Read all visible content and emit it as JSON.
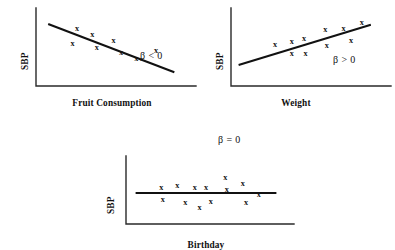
{
  "figure": {
    "background_color": "#ffffff",
    "marker_glyph": "x",
    "line_color": "#111111",
    "axis_color": "#2a2a2a"
  },
  "chart_data": [
    {
      "type": "scatter",
      "title": "",
      "xlabel": "Fruit Consumption",
      "ylabel": "SBP",
      "annotation": "β < 0",
      "xlim": [
        0,
        100
      ],
      "ylim": [
        0,
        100
      ],
      "grid": false,
      "legend": "none",
      "points": [
        {
          "x": 27,
          "y": 79
        },
        {
          "x": 24,
          "y": 58
        },
        {
          "x": 37,
          "y": 70
        },
        {
          "x": 40,
          "y": 53
        },
        {
          "x": 51,
          "y": 63
        },
        {
          "x": 56,
          "y": 45
        },
        {
          "x": 66,
          "y": 38
        },
        {
          "x": 79,
          "y": 48
        }
      ],
      "fit_line": {
        "x1": 8,
        "y1": 86,
        "x2": 91,
        "y2": 19,
        "slope_sign": "negative"
      }
    },
    {
      "type": "scatter",
      "title": "",
      "xlabel": "Weight",
      "ylabel": "SBP",
      "annotation": "β > 0",
      "xlim": [
        0,
        100
      ],
      "ylim": [
        0,
        100
      ],
      "grid": false,
      "legend": "none",
      "points": [
        {
          "x": 29,
          "y": 57
        },
        {
          "x": 40,
          "y": 61
        },
        {
          "x": 40,
          "y": 44
        },
        {
          "x": 48,
          "y": 65
        },
        {
          "x": 49,
          "y": 44
        },
        {
          "x": 62,
          "y": 77
        },
        {
          "x": 63,
          "y": 55
        },
        {
          "x": 74,
          "y": 79
        },
        {
          "x": 79,
          "y": 62
        },
        {
          "x": 86,
          "y": 88
        }
      ],
      "fit_line": {
        "x1": 5,
        "y1": 29,
        "x2": 92,
        "y2": 85,
        "slope_sign": "positive"
      }
    },
    {
      "type": "scatter",
      "title": "",
      "xlabel": "Birthday",
      "ylabel": "SBP",
      "annotation": "β = 0",
      "xlim": [
        0,
        100
      ],
      "ylim": [
        0,
        100
      ],
      "grid": false,
      "legend": "none",
      "points": [
        {
          "x": 22,
          "y": 58
        },
        {
          "x": 23,
          "y": 38
        },
        {
          "x": 32,
          "y": 61
        },
        {
          "x": 37,
          "y": 34
        },
        {
          "x": 43,
          "y": 58
        },
        {
          "x": 46,
          "y": 25
        },
        {
          "x": 50,
          "y": 58
        },
        {
          "x": 53,
          "y": 35
        },
        {
          "x": 62,
          "y": 74
        },
        {
          "x": 63,
          "y": 55
        },
        {
          "x": 73,
          "y": 65
        },
        {
          "x": 75,
          "y": 33
        },
        {
          "x": 83,
          "y": 47
        }
      ],
      "fit_line": {
        "x1": 6,
        "y1": 50,
        "x2": 94,
        "y2": 50,
        "slope_sign": "zero"
      }
    }
  ]
}
